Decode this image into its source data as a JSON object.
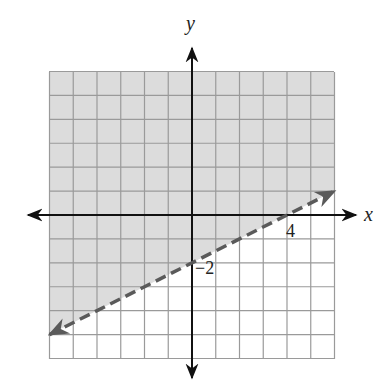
{
  "chart_data": {
    "type": "line",
    "title": "",
    "xlabel": "x",
    "ylabel": "y",
    "xlim": [
      -6,
      6
    ],
    "ylim": [
      -6,
      6
    ],
    "grid": true,
    "grid_step": 1,
    "legend": null,
    "series": [
      {
        "name": "boundary",
        "style": "dashed",
        "equation": "y = 0.5x - 2",
        "slope": 0.5,
        "intercept": -2,
        "x": [
          -6,
          6
        ],
        "y": [
          -5,
          1
        ],
        "arrows": "both"
      }
    ],
    "shaded_region": "above boundary line (y > 0.5x - 2)",
    "annotations": [
      {
        "text": "4",
        "x": 4,
        "y": 0,
        "meaning": "x-intercept"
      },
      {
        "text": "−2",
        "x": 0,
        "y": -2,
        "meaning": "y-intercept"
      }
    ],
    "colors": {
      "shade": "#dcdcdc",
      "grid": "#9a9a9a",
      "boundary": "#5a5a5a",
      "axes": "#111111"
    }
  },
  "labels": {
    "x_axis": "x",
    "y_axis": "y",
    "x_intercept": "4",
    "y_intercept": "−2"
  }
}
